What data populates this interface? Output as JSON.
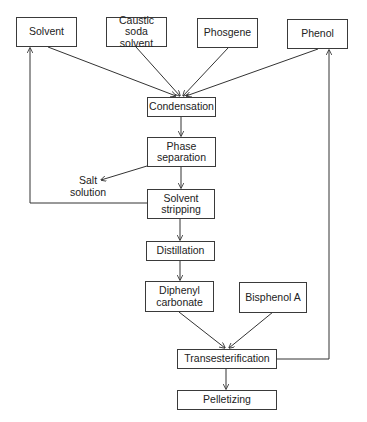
{
  "diagram": {
    "type": "process-flow",
    "nodes": {
      "solvent": "Solvent",
      "caustic_soda_solvent": "Caustic soda solvent",
      "phosgene": "Phosgene",
      "phenol": "Phenol",
      "condensation": "Condensation",
      "phase_separation": "Phase separation",
      "solvent_stripping": "Solvent stripping",
      "distillation": "Distillation",
      "diphenyl_carbonate": "Diphenyl carbonate",
      "bisphenol_a": "Bisphenol A",
      "transesterification": "Transesterification",
      "pelletizing": "Pelletizing"
    },
    "side_outputs": {
      "salt_solution": "Salt solution"
    },
    "edges": [
      [
        "Solvent",
        "Condensation"
      ],
      [
        "Caustic soda solvent",
        "Condensation"
      ],
      [
        "Phosgene",
        "Condensation"
      ],
      [
        "Phenol",
        "Condensation"
      ],
      [
        "Condensation",
        "Phase separation"
      ],
      [
        "Phase separation",
        "Salt solution"
      ],
      [
        "Phase separation",
        "Solvent stripping"
      ],
      [
        "Solvent stripping",
        "Solvent"
      ],
      [
        "Solvent stripping",
        "Distillation"
      ],
      [
        "Distillation",
        "Diphenyl carbonate"
      ],
      [
        "Diphenyl carbonate",
        "Transesterification"
      ],
      [
        "Bisphenol A",
        "Transesterification"
      ],
      [
        "Transesterification",
        "Phenol"
      ],
      [
        "Transesterification",
        "Pelletizing"
      ]
    ]
  }
}
